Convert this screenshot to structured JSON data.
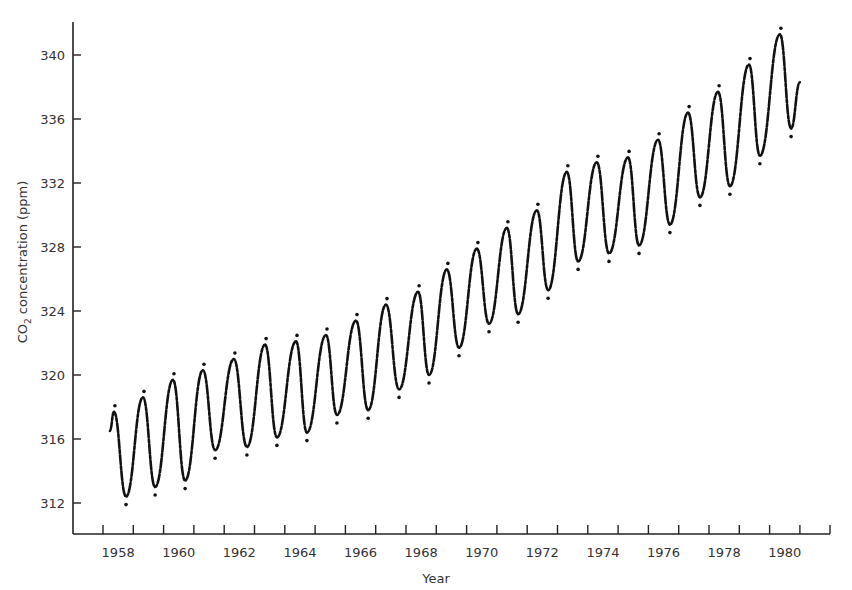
{
  "chart_data": {
    "type": "line",
    "title": "",
    "xlabel": "Year",
    "ylabel": "CO2 concentration (ppm)",
    "ylabel_parts": {
      "main": "CO",
      "subscript": "2",
      "rest": " concentration (ppm)"
    },
    "xlim": [
      1957.9,
      1981.95
    ],
    "ylim": [
      310.4,
      341.9
    ],
    "x_tick_labels": [
      "1958",
      "1960",
      "1962",
      "1964",
      "1966",
      "1968",
      "1970",
      "1972",
      "1974",
      "1976",
      "1978",
      "1980"
    ],
    "x_minor_ticks_years": [
      1958,
      1959,
      1960,
      1961,
      1962,
      1963,
      1964,
      1965,
      1966,
      1967,
      1968,
      1969,
      1970,
      1971,
      1972,
      1973,
      1974,
      1975,
      1976,
      1977,
      1978,
      1979,
      1980,
      1981
    ],
    "y_ticks": [
      312,
      316,
      320,
      324,
      328,
      332,
      336,
      340
    ],
    "y_tick_labels": [
      "312",
      "316",
      "320",
      "324",
      "328",
      "332",
      "336",
      "340"
    ],
    "grid": false,
    "legend": null,
    "series": [
      {
        "name": "Monthly mean CO2 (Mauna Loa)",
        "style": "dotted-solid line, black",
        "x": [
          1958.23,
          1958.36,
          1958.76,
          1959.32,
          1959.72,
          1960.31,
          1960.71,
          1961.3,
          1961.7,
          1962.32,
          1962.75,
          1963.35,
          1963.74,
          1964.37,
          1964.73,
          1965.36,
          1965.72,
          1966.35,
          1966.75,
          1967.34,
          1967.77,
          1968.4,
          1968.76,
          1969.35,
          1969.75,
          1970.34,
          1970.74,
          1971.33,
          1971.7,
          1972.32,
          1972.69,
          1973.31,
          1973.68,
          1974.3,
          1974.7,
          1975.33,
          1975.69,
          1976.32,
          1976.71,
          1977.31,
          1977.7,
          1978.3,
          1978.69,
          1979.32,
          1979.68,
          1980.34,
          1980.71,
          1981.0
        ],
        "y": [
          316.5,
          317.7,
          312.4,
          318.6,
          313.0,
          319.7,
          313.4,
          320.3,
          315.3,
          321.0,
          315.5,
          321.9,
          316.1,
          322.1,
          316.4,
          322.5,
          317.5,
          323.4,
          317.8,
          324.4,
          319.1,
          325.2,
          320.0,
          326.6,
          321.7,
          327.9,
          323.2,
          329.2,
          323.8,
          330.3,
          325.3,
          332.7,
          327.1,
          333.3,
          327.6,
          333.6,
          328.1,
          334.7,
          329.4,
          336.4,
          331.1,
          337.7,
          331.8,
          339.4,
          333.7,
          341.3,
          335.4,
          338.3
        ]
      }
    ]
  },
  "plot_geometry": {
    "axis_left_px": 73,
    "axis_bottom_px": 534,
    "axis_top_px": 22,
    "axis_right_px": 830,
    "year1958_px": 103,
    "px_per_year": 30.3,
    "ppm340_px": 55,
    "px_per_ppm": 16
  }
}
